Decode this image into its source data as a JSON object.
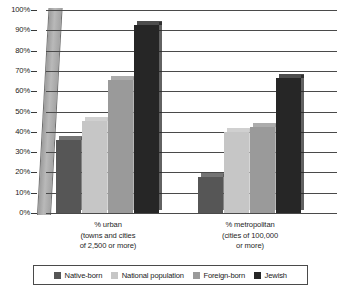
{
  "chart_data": {
    "type": "bar",
    "title": "",
    "subtitle": "",
    "xlabel": "",
    "ylabel": "",
    "ylim": [
      0,
      100
    ],
    "y_tick_labels": [
      "100%",
      "90%",
      "80%",
      "70%",
      "60%",
      "50%",
      "40%",
      "30%",
      "20%",
      "10%",
      "0%"
    ],
    "y_tick_values": [
      100,
      90,
      80,
      70,
      60,
      50,
      40,
      30,
      20,
      10,
      0
    ],
    "grid": true,
    "legend_position": "bottom",
    "categories": [
      "% urban\n(towns and cities\nof 2,500 or more)",
      "% metropolitan\n(cities of 100,000\nor more)"
    ],
    "category_lines": [
      [
        "% urban",
        "(towns and cities",
        "of 2,500 or more)"
      ],
      [
        "% metropolitan",
        "(cities of 100,000",
        "or more)"
      ]
    ],
    "series": [
      {
        "name": "Native-born",
        "color": "#565656",
        "values": [
          36,
          17.5
        ]
      },
      {
        "name": "National population",
        "color": "#c6c6c6",
        "values": [
          45.5,
          40
        ]
      },
      {
        "name": "Foreign-born",
        "color": "#9a9a9a",
        "values": [
          65.5,
          42.5
        ]
      },
      {
        "name": "Jewish",
        "color": "#262626",
        "values": [
          92.5,
          66.5
        ]
      }
    ]
  },
  "legend": {
    "items": [
      {
        "label": "Native-born",
        "color": "#565656"
      },
      {
        "label": "National population",
        "color": "#c6c6c6"
      },
      {
        "label": "Foreign-born",
        "color": "#9a9a9a"
      },
      {
        "label": "Jewish",
        "color": "#262626"
      }
    ]
  }
}
